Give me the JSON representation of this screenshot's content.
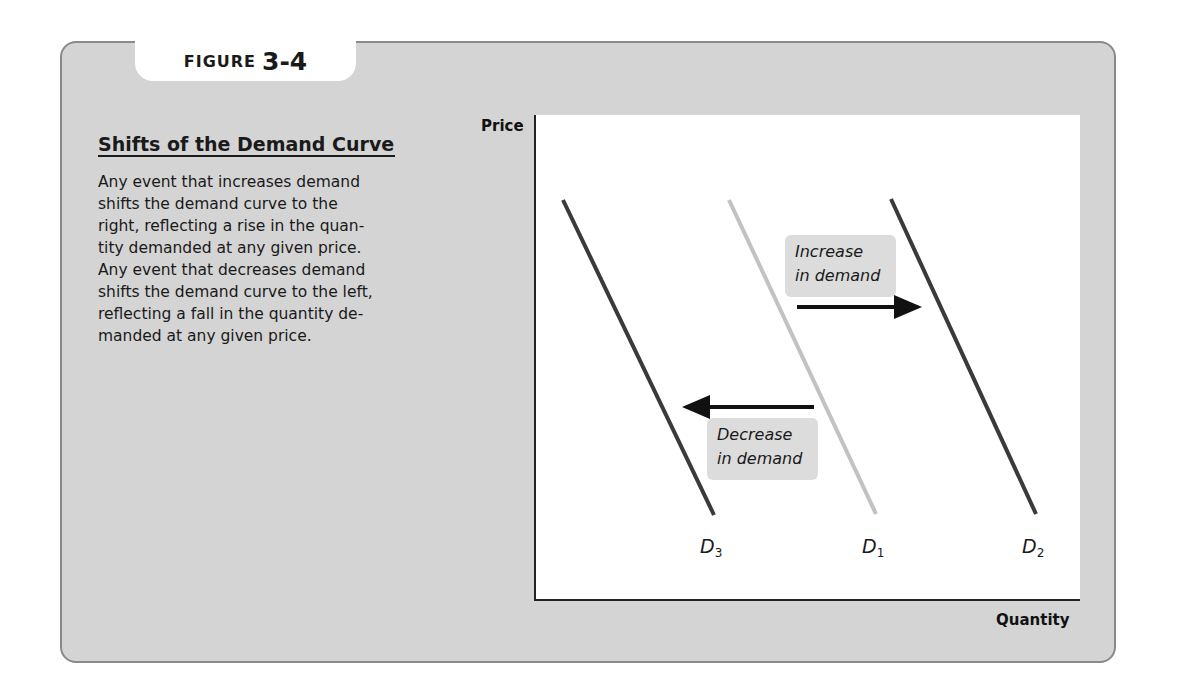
{
  "figure": {
    "label_word": "FIGURE",
    "label_number": "3-4"
  },
  "caption": {
    "title": "Shifts of the Demand Curve",
    "lines": [
      "Any event that increases demand",
      "shifts the demand curve to the",
      "right, reflecting a rise in the quan-",
      "tity demanded at any given price.",
      "Any event that decreases demand",
      "shifts the demand curve to the left,",
      "reflecting a fall in the quantity de-",
      "manded at any given price."
    ]
  },
  "chart_data": {
    "type": "line",
    "title": "Shifts of the Demand Curve",
    "xlabel": "Quantity",
    "ylabel": "Price",
    "grid": false,
    "legend": "none (curves labeled directly)",
    "series": [
      {
        "name": "D3",
        "label_main": "D",
        "label_sub": "3",
        "color": "#3a3a3a",
        "points": [
          [
            563,
            200
          ],
          [
            714,
            515
          ]
        ]
      },
      {
        "name": "D1",
        "label_main": "D",
        "label_sub": "1",
        "color": "#c2c2c2",
        "points": [
          [
            729,
            200
          ],
          [
            876,
            514
          ]
        ]
      },
      {
        "name": "D2",
        "label_main": "D",
        "label_sub": "2",
        "color": "#3a3a3a",
        "points": [
          [
            891,
            199
          ],
          [
            1036,
            514
          ]
        ]
      }
    ],
    "annotations": [
      {
        "text_line1": "Increase",
        "text_line2": "in demand",
        "arrow": {
          "from": [
            797,
            307
          ],
          "to": [
            930,
            307
          ],
          "direction": "right"
        }
      },
      {
        "text_line1": "Decrease",
        "text_line2": "in demand",
        "arrow": {
          "from": [
            814,
            407
          ],
          "to": [
            674,
            407
          ],
          "direction": "left"
        }
      }
    ]
  }
}
